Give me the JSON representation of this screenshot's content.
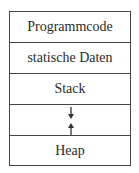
{
  "diagram": {
    "type": "memory-layout",
    "segments": [
      {
        "label": "Programmcode"
      },
      {
        "label": "statische Daten"
      },
      {
        "label": "Stack"
      },
      {
        "label": "",
        "arrows": [
          "down",
          "up"
        ]
      },
      {
        "label": "Heap"
      }
    ],
    "colors": {
      "border": "#444444",
      "text": "#2a2a2a",
      "background": "#ffffff"
    }
  }
}
